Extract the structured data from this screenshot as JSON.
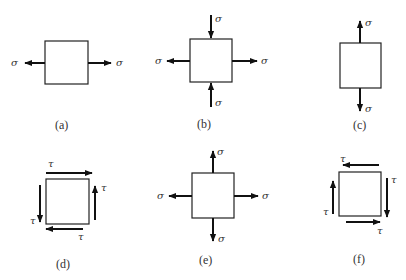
{
  "figure": {
    "panels": [
      {
        "id": "a",
        "label": "(a)",
        "description": "uniaxial tension, horizontal",
        "symbols": {
          "left": "σ",
          "right": "σ"
        }
      },
      {
        "id": "b",
        "label": "(b)",
        "description": "horizontal tension, vertical compression",
        "symbols": {
          "top": "σ",
          "bottom": "σ",
          "left": "σ",
          "right": "σ"
        }
      },
      {
        "id": "c",
        "label": "(c)",
        "description": "uniaxial tension, vertical",
        "symbols": {
          "top": "σ",
          "bottom": "σ"
        }
      },
      {
        "id": "d",
        "label": "(d)",
        "description": "pure shear, clockwise top",
        "symbols": {
          "top": "τ",
          "right": "τ",
          "bottom": "τ",
          "left": "τ"
        }
      },
      {
        "id": "e",
        "label": "(e)",
        "description": "biaxial tension",
        "symbols": {
          "top": "σ",
          "bottom": "σ",
          "left": "σ",
          "right": "σ"
        }
      },
      {
        "id": "f",
        "label": "(f)",
        "description": "pure shear, reversed",
        "symbols": {
          "top": "τ",
          "right": "τ",
          "bottom": "τ",
          "left": "τ"
        }
      }
    ]
  }
}
